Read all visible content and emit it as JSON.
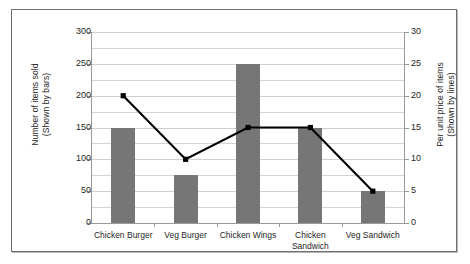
{
  "chart_data": {
    "type": "bar",
    "title": "",
    "subtitle": "",
    "categories": [
      "Chicken Burger",
      "Veg Burger",
      "Chicken Wings",
      "Chicken\nSandwich",
      "Veg Sandwich"
    ],
    "series": [
      {
        "name": "Number of items sold",
        "kind": "bar",
        "axis": "left",
        "color": "#767676",
        "values": [
          150,
          75,
          250,
          150,
          50
        ]
      },
      {
        "name": "Per unit price of items",
        "kind": "line",
        "axis": "right",
        "color": "#000000",
        "values": [
          20,
          10,
          15,
          15,
          5
        ]
      }
    ],
    "xlabel": "",
    "ylabel": "Number of items sold\n(Shown by bars)",
    "y2label": "Per unit price of items\n(Shown by lines)",
    "ylim": [
      0,
      300
    ],
    "y2lim": [
      0,
      30
    ],
    "yticks": [
      0,
      50,
      100,
      150,
      200,
      250,
      300
    ],
    "y2ticks": [
      0,
      5,
      10,
      15,
      20,
      25,
      30
    ],
    "ytick_labels": [
      "0",
      "50",
      "100",
      "150",
      "200",
      "250",
      "300"
    ],
    "y2tick_labels": [
      "0",
      "5",
      "10",
      "15",
      "20",
      "25",
      "30"
    ],
    "gridlines": {
      "visible": true,
      "step": 25,
      "color": "#d4d4d4"
    },
    "legend": {
      "visible": false,
      "position": "none"
    },
    "frame": {
      "visible": true,
      "color": "#6e6e70"
    }
  },
  "axes": {
    "left_title_line1": "Number of items sold",
    "left_title_line2": "(Shown by bars)",
    "right_title_line1": "Per unit price of items",
    "right_title_line2": "(Shown by lines)"
  }
}
